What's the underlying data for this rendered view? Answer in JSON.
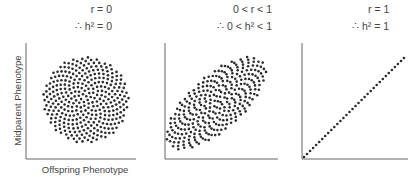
{
  "panels": [
    {
      "line1": "r = 0",
      "line2": "∴ h² = 0",
      "shape": "circle",
      "correlation": "none"
    },
    {
      "line1": "0 < r < 1",
      "line2": "∴ 0 < h² < 1",
      "shape": "tilted-ellipse",
      "correlation": "partial"
    },
    {
      "line1": "r = 1",
      "line2": "∴ h² = 1",
      "shape": "diagonal-line",
      "correlation": "perfect"
    }
  ],
  "axes": {
    "ylabel": "Midparent Phenotype",
    "xlabel": "Offspring Phenotype"
  },
  "colors": {
    "dot": "#2b2b2b",
    "axis": "#666666"
  }
}
